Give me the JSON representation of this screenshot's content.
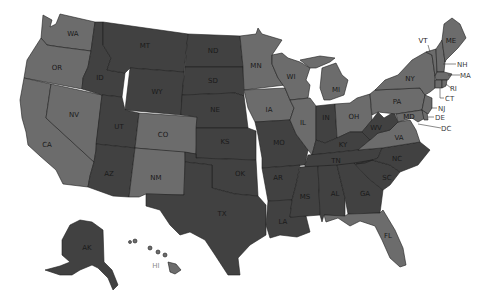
{
  "map": {
    "title": "United States map",
    "colors": {
      "light": "#6c6c6c",
      "dark": "#414141",
      "border": "#1e1e1e",
      "background": "#ffffff"
    },
    "states": [
      {
        "abbr": "WA",
        "shade": "light"
      },
      {
        "abbr": "OR",
        "shade": "light"
      },
      {
        "abbr": "CA",
        "shade": "light"
      },
      {
        "abbr": "NV",
        "shade": "light"
      },
      {
        "abbr": "ID",
        "shade": "dark"
      },
      {
        "abbr": "MT",
        "shade": "dark"
      },
      {
        "abbr": "WY",
        "shade": "dark"
      },
      {
        "abbr": "UT",
        "shade": "dark"
      },
      {
        "abbr": "AZ",
        "shade": "dark"
      },
      {
        "abbr": "CO",
        "shade": "light"
      },
      {
        "abbr": "NM",
        "shade": "light"
      },
      {
        "abbr": "ND",
        "shade": "dark"
      },
      {
        "abbr": "SD",
        "shade": "dark"
      },
      {
        "abbr": "NE",
        "shade": "dark"
      },
      {
        "abbr": "KS",
        "shade": "dark"
      },
      {
        "abbr": "OK",
        "shade": "dark"
      },
      {
        "abbr": "TX",
        "shade": "dark"
      },
      {
        "abbr": "MN",
        "shade": "light"
      },
      {
        "abbr": "IA",
        "shade": "light"
      },
      {
        "abbr": "MO",
        "shade": "dark"
      },
      {
        "abbr": "AR",
        "shade": "dark"
      },
      {
        "abbr": "LA",
        "shade": "dark"
      },
      {
        "abbr": "WI",
        "shade": "light"
      },
      {
        "abbr": "IL",
        "shade": "light"
      },
      {
        "abbr": "MI",
        "shade": "light"
      },
      {
        "abbr": "IN",
        "shade": "dark"
      },
      {
        "abbr": "OH",
        "shade": "light"
      },
      {
        "abbr": "KY",
        "shade": "dark"
      },
      {
        "abbr": "TN",
        "shade": "dark"
      },
      {
        "abbr": "MS",
        "shade": "dark"
      },
      {
        "abbr": "AL",
        "shade": "dark"
      },
      {
        "abbr": "GA",
        "shade": "dark"
      },
      {
        "abbr": "FL",
        "shade": "light"
      },
      {
        "abbr": "SC",
        "shade": "dark"
      },
      {
        "abbr": "NC",
        "shade": "dark"
      },
      {
        "abbr": "VA",
        "shade": "light"
      },
      {
        "abbr": "WV",
        "shade": "dark"
      },
      {
        "abbr": "PA",
        "shade": "light"
      },
      {
        "abbr": "NY",
        "shade": "light"
      },
      {
        "abbr": "VT",
        "shade": "light"
      },
      {
        "abbr": "NH",
        "shade": "light"
      },
      {
        "abbr": "ME",
        "shade": "light"
      },
      {
        "abbr": "MA",
        "shade": "light"
      },
      {
        "abbr": "RI",
        "shade": "light"
      },
      {
        "abbr": "CT",
        "shade": "light"
      },
      {
        "abbr": "NJ",
        "shade": "light"
      },
      {
        "abbr": "DE",
        "shade": "light"
      },
      {
        "abbr": "MD",
        "shade": "light"
      },
      {
        "abbr": "DC",
        "shade": "light"
      },
      {
        "abbr": "AK",
        "shade": "dark"
      },
      {
        "abbr": "HI",
        "shade": "light"
      }
    ],
    "labels": {
      "WA": "WA",
      "OR": "OR",
      "CA": "CA",
      "NV": "NV",
      "ID": "ID",
      "MT": "MT",
      "WY": "WY",
      "UT": "UT",
      "AZ": "AZ",
      "CO": "CO",
      "NM": "NM",
      "ND": "ND",
      "SD": "SD",
      "NE": "NE",
      "KS": "KS",
      "OK": "OK",
      "TX": "TX",
      "MN": "MN",
      "IA": "IA",
      "MO": "MO",
      "AR": "AR",
      "LA": "LA",
      "WI": "WI",
      "IL": "IL",
      "MI": "MI",
      "IN": "IN",
      "OH": "OH",
      "KY": "KY",
      "TN": "TN",
      "MS": "MS",
      "AL": "AL",
      "GA": "GA",
      "FL": "FL",
      "SC": "SC",
      "NC": "NC",
      "VA": "VA",
      "WV": "WV",
      "PA": "PA",
      "NY": "NY",
      "VT": "VT",
      "NH": "NH",
      "ME": "ME",
      "MA": "MA",
      "RI": "RI",
      "CT": "CT",
      "NJ": "NJ",
      "DE": "DE",
      "MD": "MD",
      "DC": "DC",
      "AK": "AK",
      "HI": "HI"
    }
  }
}
